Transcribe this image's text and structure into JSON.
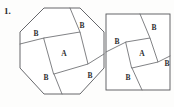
{
  "figure": {
    "problem_number": "1.",
    "stroke_color": "#55565a",
    "label_color": "#2f2f31",
    "background_color": "#fdfdfc"
  },
  "diagrams": [
    {
      "id": "octagon-diagram",
      "shape": "octagon",
      "center_region": {
        "label": "A"
      },
      "outer_regions": [
        {
          "label": "B",
          "position": "upper-right"
        },
        {
          "label": "B",
          "position": "left"
        },
        {
          "label": "B",
          "position": "lower-left"
        },
        {
          "label": "B",
          "position": "right"
        }
      ]
    },
    {
      "id": "square-diagram",
      "shape": "square",
      "center_region": {
        "label": "A"
      },
      "outer_regions": [
        {
          "label": "B",
          "position": "upper-right"
        },
        {
          "label": "B",
          "position": "left"
        },
        {
          "label": "B",
          "position": "lower-left"
        },
        {
          "label": "B",
          "position": "right"
        }
      ]
    }
  ]
}
